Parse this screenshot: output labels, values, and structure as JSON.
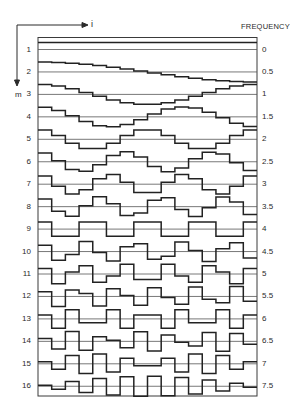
{
  "axes": {
    "horizontal_label": "i",
    "vertical_label": "m",
    "right_header": "FREQUENCY"
  },
  "chart_data": {
    "type": "line",
    "title": "",
    "xlabel": "i",
    "ylabel": "m",
    "right_axis_label": "FREQUENCY",
    "n_samples": 16,
    "rows": [
      {
        "m": "1",
        "frequency": "0"
      },
      {
        "m": "2",
        "frequency": "0.5"
      },
      {
        "m": "3",
        "frequency": "1"
      },
      {
        "m": "4",
        "frequency": "1.5"
      },
      {
        "m": "5",
        "frequency": "2"
      },
      {
        "m": "6",
        "frequency": "2.5"
      },
      {
        "m": "7",
        "frequency": "3"
      },
      {
        "m": "8",
        "frequency": "3.5"
      },
      {
        "m": "9",
        "frequency": "4"
      },
      {
        "m": "10",
        "frequency": "4.5"
      },
      {
        "m": "11",
        "frequency": "5"
      },
      {
        "m": "12",
        "frequency": "5.5"
      },
      {
        "m": "13",
        "frequency": "6"
      },
      {
        "m": "14",
        "frequency": "6.5"
      },
      {
        "m": "15",
        "frequency": "7"
      },
      {
        "m": "16",
        "frequency": "7.5"
      }
    ],
    "grid": false,
    "legend": "none"
  }
}
